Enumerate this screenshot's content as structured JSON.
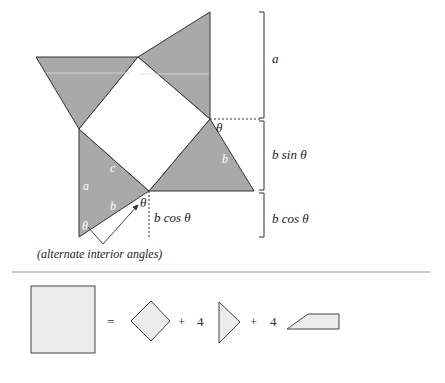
{
  "diagram": {
    "bracket_labels": [
      "a",
      "b sin θ",
      "b cos θ"
    ],
    "angle_labels": {
      "theta_right": "θ",
      "theta_mid": "θ",
      "theta_bottom": "θ"
    },
    "side_labels": {
      "a": "a",
      "c": "c",
      "b_left": "b",
      "b_right": "b"
    },
    "dotted_label": "b cos θ",
    "annotation": "(alternate interior angles)"
  },
  "equation": {
    "equals": "=",
    "plus1": "+",
    "count1": "4",
    "plus2": "+",
    "count2": "4"
  },
  "colors": {
    "shade": "#a9a9a9",
    "light": "#ececec",
    "line": "#333333"
  }
}
